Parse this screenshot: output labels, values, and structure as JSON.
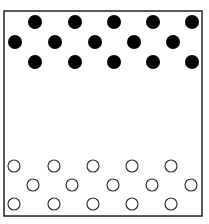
{
  "diagram": {
    "box": {
      "x": 4,
      "y": 11,
      "width": 198,
      "height": 205,
      "stroke": "#222222"
    },
    "filled_particles": {
      "color": "#000000",
      "radius": 7,
      "points": [
        [
          35,
          22
        ],
        [
          75,
          22
        ],
        [
          114,
          22
        ],
        [
          153,
          22
        ],
        [
          192,
          22
        ],
        [
          15,
          42
        ],
        [
          55,
          42
        ],
        [
          95,
          42
        ],
        [
          134,
          42
        ],
        [
          173,
          42
        ],
        [
          35,
          62
        ],
        [
          75,
          62
        ],
        [
          114,
          62
        ],
        [
          153,
          62
        ],
        [
          192,
          62
        ]
      ]
    },
    "open_particles": {
      "stroke": "#333333",
      "radius": 6,
      "points": [
        [
          14,
          166
        ],
        [
          54,
          166
        ],
        [
          93,
          166
        ],
        [
          132,
          166
        ],
        [
          171,
          166
        ],
        [
          33,
          185
        ],
        [
          72,
          185
        ],
        [
          113,
          185
        ],
        [
          152,
          185
        ],
        [
          191,
          185
        ],
        [
          14,
          204
        ],
        [
          54,
          204
        ],
        [
          93,
          204
        ],
        [
          132,
          204
        ],
        [
          171,
          204
        ]
      ]
    }
  }
}
